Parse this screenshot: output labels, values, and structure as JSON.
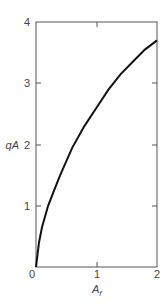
{
  "chart_data": {
    "type": "line",
    "title": "",
    "xlabel": "A_f",
    "ylabel": "qA",
    "xlim": [
      0,
      2
    ],
    "ylim": [
      0,
      4
    ],
    "xticks": [
      "0",
      "1",
      "2"
    ],
    "yticks": [
      "0",
      "1",
      "2",
      "3",
      "4"
    ],
    "grid": false,
    "legend": null,
    "series": [
      {
        "name": "qA",
        "x": [
          0,
          0.05,
          0.1,
          0.2,
          0.3,
          0.4,
          0.6,
          0.8,
          1.0,
          1.2,
          1.4,
          1.6,
          1.8,
          2.0
        ],
        "y": [
          0,
          0.4,
          0.65,
          1.0,
          1.25,
          1.5,
          1.95,
          2.3,
          2.6,
          2.9,
          3.15,
          3.35,
          3.55,
          3.7
        ]
      }
    ]
  },
  "labels": {
    "x_axis": "A",
    "x_axis_sub": "f",
    "y_axis": "qA",
    "x0": "0",
    "x1": "1",
    "x2": "2",
    "y1": "1",
    "y2": "2",
    "y3": "3",
    "y4": "4"
  }
}
